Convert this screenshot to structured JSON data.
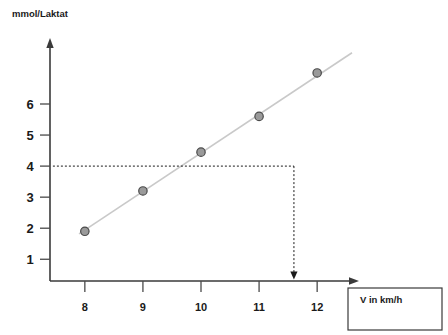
{
  "chart_data": {
    "type": "scatter",
    "title": "",
    "subtitle": "",
    "ylabel": "mmol/Laktat",
    "xlabel": "V in km/h",
    "x": [
      8,
      9,
      10,
      11,
      12
    ],
    "values": [
      1.9,
      3.2,
      4.45,
      5.6,
      7.0
    ],
    "series": [
      {
        "name": "Laktat",
        "values": [
          1.9,
          3.2,
          4.45,
          5.6,
          7.0
        ]
      }
    ],
    "xtick_labels": [
      "8",
      "9",
      "10",
      "11",
      "12"
    ],
    "ytick_labels": [
      "1",
      "2",
      "3",
      "4",
      "5",
      "6"
    ],
    "ytick_values": [
      1,
      2,
      3,
      4,
      5,
      6
    ],
    "xlim": [
      7.4,
      12.6
    ],
    "ylim": [
      0.3,
      7.9
    ],
    "grid": false,
    "legend": "none",
    "trendline": {
      "type": "linear",
      "x_start": 7.9,
      "y_start": 1.82,
      "x_end": 12.6,
      "y_end": 7.65
    },
    "annotations": [
      {
        "name": "threshold-horizontal",
        "style": "dashed",
        "y": 4,
        "x_start": 7.45,
        "x_end": 11.6
      },
      {
        "name": "threshold-vertical-arrow",
        "style": "dashed-with-arrow",
        "x": 11.6,
        "y_start": 4,
        "y_end": 0.35
      }
    ]
  },
  "axes": {
    "y_axis_label": "mmol/Laktat",
    "x_axis_label": "V in km/h",
    "y_ticks": [
      {
        "label": "6",
        "value": 6
      },
      {
        "label": "5",
        "value": 5
      },
      {
        "label": "4",
        "value": 4
      },
      {
        "label": "3",
        "value": 3
      },
      {
        "label": "2",
        "value": 2
      },
      {
        "label": "1",
        "value": 1
      }
    ],
    "x_ticks": [
      {
        "label": "8",
        "value": 8
      },
      {
        "label": "9",
        "value": 9
      },
      {
        "label": "10",
        "value": 10
      },
      {
        "label": "11",
        "value": 11
      },
      {
        "label": "12",
        "value": 12
      }
    ]
  },
  "colors": {
    "axis": "#3a3a3a",
    "point_fill": "#9a9a9a",
    "point_stroke": "#4a4a4a",
    "trend_line": "#c9c9c9",
    "guide_dashed": "#1a1a1a",
    "text": "#1a1a1a",
    "background": "#ffffff"
  }
}
